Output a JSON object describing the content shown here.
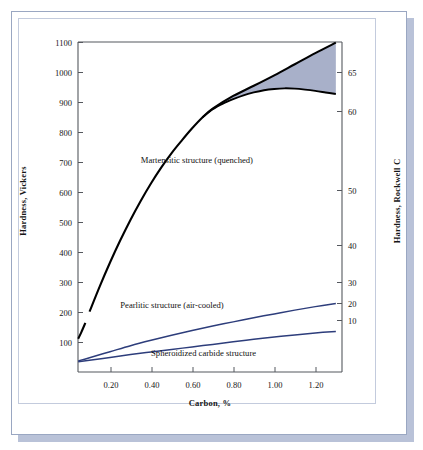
{
  "figure": {
    "xlabel": "Carbon, %",
    "ylabel_left": "Hardness, Vickers",
    "ylabel_right": "Hardness, Rockwell C"
  },
  "chart_data": {
    "type": "line",
    "title": "",
    "xlabel": "Carbon, %",
    "ylabel": "Hardness, Vickers",
    "ylabel_secondary": "Hardness, Rockwell C",
    "xlim": [
      0.044,
      1.33
    ],
    "ylim": [
      60,
      1100
    ],
    "ylim_secondary": [
      5,
      70
    ],
    "grid": false,
    "legend": "inline annotations",
    "xticks": [
      "0.20",
      "0.40",
      "0.60",
      "0.80",
      "1.00",
      "1.20"
    ],
    "xtick_values": [
      0.2,
      0.4,
      0.6,
      0.8,
      1.0,
      1.2
    ],
    "yticks_left": [
      "100",
      "200",
      "300",
      "400",
      "500",
      "600",
      "700",
      "800",
      "900",
      "1000",
      "1100"
    ],
    "ytick_values_left": [
      100,
      200,
      300,
      400,
      500,
      600,
      700,
      800,
      900,
      1000,
      1100
    ],
    "yticks_right": [
      "10",
      "20",
      "30",
      "40",
      "50",
      "60",
      "65"
    ],
    "ytick_values_right": [
      10,
      20,
      30,
      40,
      50,
      60,
      65
    ],
    "colors": {
      "martensite_line": "#000000",
      "pearlite_line": "#2d3d7b",
      "spheroidized_line": "#2d3d7b",
      "shaded_band": "#a8b0c9",
      "axis": "#55585e"
    },
    "series": [
      {
        "name": "Martensitic structure (quenched)",
        "label": "Martensitic structure (quenched)",
        "color": "#000000",
        "note": "upper bound, fully quenched; short break in line near 0.07-0.09 %C",
        "x": [
          0.045,
          0.06,
          0.08,
          0.1,
          0.15,
          0.2,
          0.25,
          0.3,
          0.35,
          0.4,
          0.45,
          0.5,
          0.55,
          0.6,
          0.65,
          0.7,
          0.8,
          0.9,
          1.0,
          1.1,
          1.2,
          1.3
        ],
        "values": [
          165,
          185,
          215,
          250,
          330,
          405,
          475,
          540,
          600,
          655,
          705,
          750,
          790,
          828,
          862,
          890,
          930,
          962,
          995,
          1030,
          1065,
          1098
        ]
      },
      {
        "name": "Martensitic structure (partly retained austenite)",
        "label": "",
        "color": "#000000",
        "note": "lower bound of shaded band; diverges from upper curve near 0.65 %C",
        "x": [
          0.65,
          0.7,
          0.75,
          0.8,
          0.85,
          0.9,
          0.95,
          1.0,
          1.05,
          1.1,
          1.15,
          1.2,
          1.25,
          1.3
        ],
        "values": [
          862,
          888,
          906,
          920,
          932,
          941,
          948,
          952,
          954,
          953,
          950,
          946,
          941,
          936
        ]
      },
      {
        "name": "Pearlitic structure (air-cooled)",
        "label": "Pearlitic structure (air-cooled)",
        "color": "#2d3d7b",
        "x": [
          0.045,
          0.1,
          0.2,
          0.3,
          0.4,
          0.5,
          0.6,
          0.7,
          0.8,
          0.9,
          1.0,
          1.1,
          1.2,
          1.3
        ],
        "values": [
          95,
          105,
          124,
          143,
          160,
          176,
          191,
          205,
          218,
          231,
          243,
          255,
          266,
          276
        ]
      },
      {
        "name": "Spheroidized carbide structure",
        "label": "Spheroidized carbide structure",
        "color": "#2d3d7b",
        "x": [
          0.045,
          0.1,
          0.2,
          0.3,
          0.4,
          0.5,
          0.6,
          0.7,
          0.8,
          0.9,
          1.0,
          1.1,
          1.2,
          1.3
        ],
        "values": [
          92,
          97,
          106,
          115,
          123,
          131,
          139,
          147,
          155,
          163,
          170,
          177,
          183,
          188
        ]
      }
    ],
    "shaded_regions": [
      {
        "name": "retained-austenite-band",
        "between": [
          "Martensitic structure (quenched)",
          "Martensitic structure (partly retained austenite)"
        ],
        "x_start": 0.65,
        "x_end": 1.3,
        "color": "#a8b0c9"
      }
    ],
    "annotations": [
      {
        "text": "Martensitic structure (quenched)",
        "x": 0.35,
        "y": 745
      },
      {
        "text": "Pearlitic structure (air-cooled)",
        "x": 0.25,
        "y": 288
      },
      {
        "text": "Spheroidized carbide structure",
        "x": 0.4,
        "y": 137
      }
    ]
  },
  "ticks": {
    "left": [
      {
        "label": "1100",
        "top": 38
      },
      {
        "label": "1000",
        "top": 68
      },
      {
        "label": "900",
        "top": 98
      },
      {
        "label": "800",
        "top": 128
      },
      {
        "label": "700",
        "top": 158
      },
      {
        "label": "600",
        "top": 188
      },
      {
        "label": "500",
        "top": 218
      },
      {
        "label": "400",
        "top": 248
      },
      {
        "label": "300",
        "top": 278
      },
      {
        "label": "200",
        "top": 308
      },
      {
        "label": "100",
        "top": 338
      }
    ],
    "right": [
      {
        "label": "65",
        "top": 68
      },
      {
        "label": "60",
        "top": 107
      },
      {
        "label": "50",
        "top": 186
      },
      {
        "label": "40",
        "top": 241
      },
      {
        "label": "30",
        "top": 278
      },
      {
        "label": "20",
        "top": 299
      },
      {
        "label": "10",
        "top": 316
      }
    ],
    "bottom": [
      {
        "label": "0.20",
        "left": 91
      },
      {
        "label": "0.40",
        "left": 132
      },
      {
        "label": "0.60",
        "left": 173
      },
      {
        "label": "0.80",
        "left": 214
      },
      {
        "label": "1.00",
        "left": 255
      },
      {
        "label": "1.20",
        "left": 296
      }
    ]
  }
}
